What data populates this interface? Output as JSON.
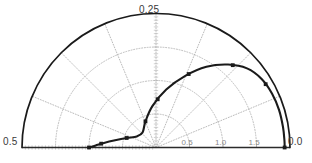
{
  "chart_data": {
    "type": "line",
    "title": "",
    "subtitle": "",
    "projection": "polar-semicircle",
    "grid": true,
    "legend": null,
    "xlabel": "",
    "ylabel": "",
    "angle_axis": {
      "name": "normalized-frequency",
      "labels": [
        {
          "text": "0.25",
          "position": "top",
          "angle_deg": 90
        },
        {
          "text": "0.5",
          "position": "left",
          "angle_deg": 180
        },
        {
          "text": "0.0",
          "position": "right",
          "angle_deg": 0
        }
      ],
      "spoke_angles_deg": [
        0,
        22.5,
        45,
        67.5,
        90,
        112.5,
        135,
        157.5,
        180
      ]
    },
    "radial_axis": {
      "tick_labels": [
        "0.5",
        "1.0",
        "1.5"
      ],
      "tick_values": [
        0.5,
        1.0,
        1.5
      ],
      "rlim": [
        0,
        2.0
      ],
      "ring_values": [
        0.5,
        1.0,
        1.5,
        2.0
      ],
      "minor_tick_count": 40
    },
    "series": [
      {
        "name": "outer-boundary",
        "style": "solid",
        "color": "#1a1a1a",
        "markers": false,
        "points_polar": [
          {
            "theta_deg": 0,
            "r": 2.0
          },
          {
            "theta_deg": 180,
            "r": 2.0
          }
        ]
      },
      {
        "name": "measured-response",
        "style": "solid",
        "color": "#1a1a1a",
        "markers": true,
        "marker_shape": "square",
        "points_polar": [
          {
            "theta_deg": 180.0,
            "r": 1.0
          },
          {
            "theta_deg": 178.0,
            "r": 0.9
          },
          {
            "theta_deg": 175.0,
            "r": 0.78
          },
          {
            "theta_deg": 170.0,
            "r": 0.62
          },
          {
            "theta_deg": 162.0,
            "r": 0.46
          },
          {
            "theta_deg": 150.0,
            "r": 0.33
          },
          {
            "theta_deg": 132.0,
            "r": 0.3
          },
          {
            "theta_deg": 112.0,
            "r": 0.42
          },
          {
            "theta_deg": 95.0,
            "r": 0.62
          },
          {
            "theta_deg": 80.0,
            "r": 0.88
          },
          {
            "theta_deg": 68.0,
            "r": 1.15
          },
          {
            "theta_deg": 58.0,
            "r": 1.42
          },
          {
            "theta_deg": 49.0,
            "r": 1.64
          },
          {
            "theta_deg": 41.0,
            "r": 1.8
          },
          {
            "theta_deg": 33.0,
            "r": 1.88
          },
          {
            "theta_deg": 25.0,
            "r": 1.91
          },
          {
            "theta_deg": 17.0,
            "r": 1.92
          },
          {
            "theta_deg": 9.0,
            "r": 1.92
          },
          {
            "theta_deg": 3.0,
            "r": 1.92
          },
          {
            "theta_deg": 0.0,
            "r": 1.92
          }
        ],
        "marker_points_polar": [
          {
            "theta_deg": 180.0,
            "r": 1.0
          },
          {
            "theta_deg": 176.0,
            "r": 0.82
          },
          {
            "theta_deg": 162.0,
            "r": 0.46
          },
          {
            "theta_deg": 112.0,
            "r": 0.42
          },
          {
            "theta_deg": 88.0,
            "r": 0.72
          },
          {
            "theta_deg": 66.0,
            "r": 1.2
          },
          {
            "theta_deg": 47.0,
            "r": 1.68
          },
          {
            "theta_deg": 30.0,
            "r": 1.89
          },
          {
            "theta_deg": 0.0,
            "r": 1.92
          }
        ]
      }
    ]
  },
  "colors": {
    "curve": "#1a1a1a",
    "grid": "#b4b4b4",
    "axis": "#2b2b2b",
    "label": "#3a3a3a",
    "tick_label": "#8a8a8a",
    "background": "#ffffff"
  }
}
